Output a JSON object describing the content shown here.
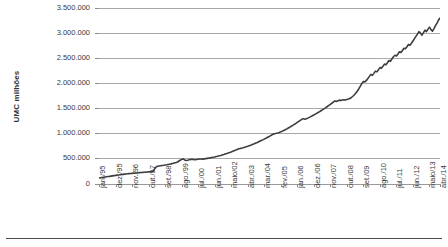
{
  "chart_data": {
    "type": "line",
    "title": "",
    "subtitle": "",
    "xlabel": "",
    "ylabel": "UMC milhões",
    "ylim": [
      0,
      3500000
    ],
    "ytick_labels": [
      "0",
      "500.000",
      "1.000.000",
      "1.500.000",
      "2.000.000",
      "2.500.000",
      "3.000.000",
      "3.500.000"
    ],
    "ytick_values": [
      0,
      500000,
      1000000,
      1500000,
      2000000,
      2500000,
      3000000,
      3500000
    ],
    "grid": "horizontal",
    "legend": "none",
    "line_color": "#3d3d3d",
    "xtick_labels": [
      "jan./95",
      "dez./95",
      "nov./96",
      "out./97",
      "set./98",
      "ago./99",
      "jul./00",
      "jun./01",
      "maio/02",
      "abr./03",
      "mar./04",
      "fev./05",
      "jan./06",
      "dez./06",
      "nov./07",
      "out./08",
      "set./09",
      "ago./10",
      "jul./11",
      "jun./12",
      "maio/13",
      "abr./14"
    ],
    "xtick_interval_months": 11,
    "x_start": "jan./95",
    "x_end": "abr./14",
    "series": [
      {
        "name": "UMC milhões",
        "values": [
          118000,
          123000,
          128000,
          133000,
          138000,
          143000,
          148000,
          152000,
          157000,
          162000,
          167000,
          171000,
          176000,
          180000,
          184000,
          188000,
          192000,
          196000,
          200000,
          203000,
          206000,
          209000,
          212000,
          215000,
          218000,
          220000,
          223000,
          226000,
          229000,
          231000,
          234000,
          236000,
          239000,
          241000,
          243000,
          246000,
          249000,
          300000,
          338000,
          352000,
          358000,
          363000,
          368000,
          372000,
          377000,
          382000,
          388000,
          394000,
          400000,
          408000,
          416000,
          424000,
          432000,
          452000,
          472000,
          489000,
          500000,
          478000,
          466000,
          473000,
          482000,
          489000,
          493000,
          487000,
          482000,
          487000,
          492000,
          496000,
          498000,
          494000,
          499000,
          505000,
          510000,
          515000,
          520000,
          526000,
          532000,
          538000,
          545000,
          552000,
          560000,
          568000,
          577000,
          586000,
          596000,
          606000,
          616000,
          627000,
          638000,
          650000,
          662000,
          674000,
          687000,
          700000,
          707000,
          714000,
          722000,
          731000,
          740000,
          750000,
          761000,
          772000,
          784000,
          796000,
          809000,
          822000,
          836000,
          850000,
          864000,
          878000,
          893000,
          908000,
          924000,
          940000,
          957000,
          975000,
          992000,
          1000000,
          1008000,
          1016000,
          1026000,
          1038000,
          1051000,
          1065000,
          1080000,
          1096000,
          1113000,
          1130000,
          1148000,
          1166000,
          1185000,
          1204000,
          1224000,
          1244000,
          1265000,
          1286000,
          1300000,
          1288000,
          1296000,
          1310000,
          1325000,
          1340000,
          1356000,
          1372000,
          1389000,
          1406000,
          1424000,
          1442000,
          1461000,
          1480000,
          1500000,
          1520000,
          1541000,
          1562000,
          1584000,
          1606000,
          1629000,
          1652000,
          1640000,
          1655000,
          1668000,
          1660000,
          1672000,
          1676000,
          1670000,
          1682000,
          1690000,
          1700000,
          1720000,
          1745000,
          1775000,
          1810000,
          1850000,
          1895000,
          1945000,
          2000000,
          2040000,
          2030000,
          2060000,
          2100000,
          2140000,
          2180000,
          2160000,
          2200000,
          2245000,
          2230000,
          2270000,
          2315000,
          2300000,
          2340000,
          2385000,
          2370000,
          2410000,
          2455000,
          2440000,
          2485000,
          2530000,
          2560000,
          2545000,
          2585000,
          2630000,
          2615000,
          2655000,
          2700000,
          2690000,
          2730000,
          2775000,
          2760000,
          2800000,
          2845000,
          2890000,
          2935000,
          2980000,
          3030000,
          3000000,
          2960000,
          3010000,
          3060000,
          3030000,
          3080000,
          3120000,
          3070000,
          3040000,
          3090000,
          3150000,
          3200000,
          3260000,
          3300000
        ]
      }
    ]
  },
  "figure": {
    "bottom_rule": "horizontal-rule"
  }
}
